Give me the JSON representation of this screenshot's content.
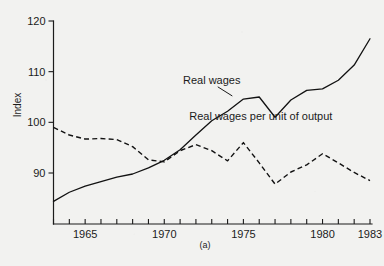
{
  "chart_data": {
    "type": "line",
    "title": "",
    "subtitle": "",
    "panel_label": "(a)",
    "xlabel": "",
    "ylabel": "Index",
    "xlim": [
      1963,
      1983
    ],
    "ylim": [
      84,
      120
    ],
    "grid": false,
    "legend_position": "inline-annotations",
    "y_ticks": [
      90,
      100,
      110,
      120
    ],
    "y_tick_labels": [
      "90",
      "100",
      "110",
      "120"
    ],
    "x_ticks": [
      1963,
      1964,
      1965,
      1966,
      1967,
      1968,
      1969,
      1970,
      1971,
      1972,
      1973,
      1974,
      1975,
      1976,
      1977,
      1978,
      1979,
      1980,
      1981,
      1982,
      1983
    ],
    "x_tick_labels_shown": {
      "1965": "1965",
      "1970": "1970",
      "1975": "1975",
      "1980": "1980",
      "1983": "1983"
    },
    "x": [
      1963,
      1964,
      1965,
      1966,
      1967,
      1968,
      1969,
      1970,
      1971,
      1972,
      1973,
      1974,
      1975,
      1976,
      1977,
      1978,
      1979,
      1980,
      1981,
      1982,
      1983
    ],
    "series": [
      {
        "name": "Real wages",
        "style": "solid",
        "label": "Real wages",
        "label_x": 1973.0,
        "label_y": 107.6,
        "leader_to_x": 1974.3,
        "leader_to_y": 105.2,
        "values": [
          84.4,
          86.2,
          87.4,
          88.3,
          89.2,
          89.8,
          91.0,
          92.5,
          94.6,
          97.5,
          100.3,
          102.2,
          104.6,
          105.0,
          101.0,
          104.4,
          106.3,
          106.6,
          108.3,
          111.3,
          116.5
        ]
      },
      {
        "name": "Real wages per unit of output",
        "style": "dashed",
        "label": "Real wages per unit of output",
        "label_x": 1976.1,
        "label_y": 100.4,
        "values": [
          99.0,
          97.5,
          96.7,
          96.8,
          96.6,
          95.2,
          92.6,
          92.2,
          94.4,
          95.6,
          94.4,
          92.4,
          96.0,
          92.0,
          87.8,
          90.2,
          91.6,
          93.8,
          92.0,
          90.1,
          88.5
        ]
      }
    ]
  },
  "axes": {
    "y_axis_title": "Index",
    "caption": "(a)"
  },
  "colors": {
    "background": "#f2f2f0",
    "ink": "#121212",
    "axis": "#1b1b1b"
  }
}
